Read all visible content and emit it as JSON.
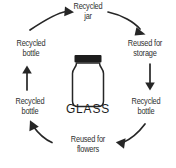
{
  "diagram": {
    "title": "GLASS",
    "center_label": "GLASS",
    "center_icon": "glass-jar-icon",
    "type": "circular-lifecycle",
    "stroke_color": "#262626",
    "text_color": "#2f2f2f",
    "background_color": "#ffffff",
    "nodes": [
      {
        "id": "recycled-jar",
        "label": "Recycled\njar",
        "position": "top"
      },
      {
        "id": "reused-for-storage",
        "label": "Reused for\nstorage",
        "position": "top-right"
      },
      {
        "id": "recycled-bottle-1",
        "label": "Recycled\nbottle",
        "position": "right"
      },
      {
        "id": "reused-for-flowers",
        "label": "Reused for\nflowers",
        "position": "bottom"
      },
      {
        "id": "recycled-bottle-2",
        "label": "Recycled\nbottle",
        "position": "left"
      },
      {
        "id": "recycled-bottle-3",
        "label": "Recycled\nbottle",
        "position": "top-left"
      }
    ],
    "arrows": [
      {
        "id": "arrow-top-left",
        "from": "recycled-bottle-3",
        "to": "recycled-jar",
        "shape": "curved",
        "direction": "right"
      },
      {
        "id": "arrow-top-right",
        "from": "recycled-jar",
        "to": "reused-for-storage",
        "shape": "curved",
        "direction": "down-right"
      },
      {
        "id": "arrow-right",
        "from": "reused-for-storage",
        "to": "recycled-bottle-1",
        "shape": "straight",
        "direction": "down"
      },
      {
        "id": "arrow-bottom-right",
        "from": "recycled-bottle-1",
        "to": "reused-for-flowers",
        "shape": "curved",
        "direction": "down-left"
      },
      {
        "id": "arrow-bottom-left",
        "from": "reused-for-flowers",
        "to": "recycled-bottle-2",
        "shape": "curved",
        "direction": "up-left"
      },
      {
        "id": "arrow-left",
        "from": "recycled-bottle-2",
        "to": "recycled-bottle-3",
        "shape": "straight",
        "direction": "up"
      }
    ]
  }
}
